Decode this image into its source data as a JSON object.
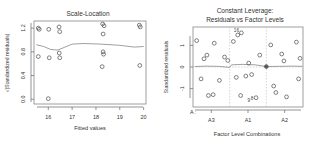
{
  "figure": {
    "background": "#ffffff",
    "point_color": "#555555",
    "line_color": "#888888",
    "axis_color": "#666666",
    "panels": 2
  },
  "chart_data": [
    {
      "type": "scatter",
      "panel": "left",
      "title": "Scale-Location",
      "xlabel": "Fitted values",
      "ylabel": "√|Standardized residuals|",
      "xlim": [
        15.4,
        20.1
      ],
      "ylim": [
        -0.08,
        1.32
      ],
      "xticks": [
        "16",
        "17",
        "18",
        "19",
        "20"
      ],
      "xtick_values": [
        16,
        17,
        18,
        19,
        20
      ],
      "yticks": [
        "0.0",
        "0.4",
        "0.8",
        "1.2"
      ],
      "ytick_values": [
        0.0,
        0.4,
        0.8,
        1.2
      ],
      "grid": false,
      "legend": "none",
      "points": [
        {
          "x": 15.58,
          "y": 1.2
        },
        {
          "x": 15.62,
          "y": 1.18
        },
        {
          "x": 16.02,
          "y": 1.18
        },
        {
          "x": 16.45,
          "y": 1.22
        },
        {
          "x": 16.48,
          "y": 1.14
        },
        {
          "x": 18.28,
          "y": 1.27
        },
        {
          "x": 18.34,
          "y": 1.24
        },
        {
          "x": 18.3,
          "y": 1.1
        },
        {
          "x": 19.82,
          "y": 1.25
        },
        {
          "x": 19.86,
          "y": 1.22
        },
        {
          "x": 15.58,
          "y": 0.72
        },
        {
          "x": 16.04,
          "y": 0.7
        },
        {
          "x": 16.46,
          "y": 0.78
        },
        {
          "x": 16.48,
          "y": 0.7
        },
        {
          "x": 18.3,
          "y": 0.8
        },
        {
          "x": 18.32,
          "y": 0.76
        },
        {
          "x": 18.26,
          "y": 0.55
        },
        {
          "x": 19.84,
          "y": 0.57
        },
        {
          "x": 16.0,
          "y": 0.01
        }
      ],
      "smooth_line": [
        {
          "x": 15.5,
          "y": 0.92
        },
        {
          "x": 15.8,
          "y": 0.89
        },
        {
          "x": 16.1,
          "y": 0.84
        },
        {
          "x": 16.4,
          "y": 0.83
        },
        {
          "x": 16.7,
          "y": 0.88
        },
        {
          "x": 17.0,
          "y": 0.93
        },
        {
          "x": 17.5,
          "y": 0.94
        },
        {
          "x": 18.2,
          "y": 0.93
        },
        {
          "x": 19.0,
          "y": 0.91
        },
        {
          "x": 19.6,
          "y": 0.88
        },
        {
          "x": 20.0,
          "y": 0.89
        }
      ],
      "point_labels": []
    },
    {
      "type": "scatter",
      "panel": "right",
      "title_line1": "Constant Leverage:",
      "title_line2": "Residuals vs Factor Levels",
      "title": "Constant Leverage: Residuals vs Factor Levels",
      "xlabel": "Factor Level Combinations",
      "ylabel": "Standardized residuals",
      "group_axis_label": "A :",
      "xlim": [
        0,
        3
      ],
      "ylim": [
        -1.85,
        1.85
      ],
      "xticks": [
        "A3",
        "A1",
        "A2"
      ],
      "xtick_values": [
        0.5,
        1.5,
        2.5
      ],
      "yticks": [
        "1",
        "0",
        "-1"
      ],
      "ytick_values": [
        1,
        0,
        -1
      ],
      "grid": false,
      "legend": "none",
      "reference_line_y": 0,
      "group_separators": [
        1.0,
        2.0
      ],
      "points": [
        {
          "x": 0.1,
          "y": 1.22
        },
        {
          "x": 0.22,
          "y": -0.55
        },
        {
          "x": 0.3,
          "y": 0.38
        },
        {
          "x": 0.38,
          "y": 0.55
        },
        {
          "x": 0.42,
          "y": -1.32
        },
        {
          "x": 0.55,
          "y": -1.28
        },
        {
          "x": 0.58,
          "y": 1.1
        },
        {
          "x": 0.72,
          "y": -0.62
        },
        {
          "x": 0.86,
          "y": 0.46
        },
        {
          "x": 0.95,
          "y": 0.3
        },
        {
          "x": 1.1,
          "y": 1.18
        },
        {
          "x": 1.18,
          "y": -0.48
        },
        {
          "x": 1.22,
          "y": 1.48
        },
        {
          "x": 1.32,
          "y": 1.58
        },
        {
          "x": 1.3,
          "y": -1.32
        },
        {
          "x": 1.44,
          "y": -0.42
        },
        {
          "x": 1.52,
          "y": 0.18
        },
        {
          "x": 1.6,
          "y": -0.35
        },
        {
          "x": 1.72,
          "y": -1.42
        },
        {
          "x": 1.82,
          "y": 0.55
        },
        {
          "x": 2.0,
          "y": 0.02
        },
        {
          "x": 2.12,
          "y": 1.02
        },
        {
          "x": 2.2,
          "y": -0.88
        },
        {
          "x": 2.26,
          "y": -1.18
        },
        {
          "x": 2.42,
          "y": 0.6
        },
        {
          "x": 2.48,
          "y": 0.28
        },
        {
          "x": 2.55,
          "y": -1.38
        },
        {
          "x": 2.82,
          "y": 1.15
        },
        {
          "x": 2.88,
          "y": -0.55
        },
        {
          "x": 2.92,
          "y": 0.4
        }
      ],
      "solid_points": [
        {
          "x": 2.0,
          "y": 0.02
        }
      ],
      "smooth_line": [
        {
          "x": 0.05,
          "y": 0.02
        },
        {
          "x": 0.35,
          "y": 0.04
        },
        {
          "x": 0.7,
          "y": 0.03
        },
        {
          "x": 1.0,
          "y": -0.02
        },
        {
          "x": 1.05,
          "y": 0.1
        },
        {
          "x": 1.35,
          "y": 0.12
        },
        {
          "x": 1.7,
          "y": 0.1
        },
        {
          "x": 2.0,
          "y": 0.02
        },
        {
          "x": 2.35,
          "y": 0.03
        },
        {
          "x": 2.7,
          "y": 0.04
        },
        {
          "x": 2.98,
          "y": 0.03
        }
      ],
      "point_labels": [
        {
          "x": 1.32,
          "y": 1.58,
          "text": "16",
          "dx": -5,
          "dy": -1
        },
        {
          "x": 1.44,
          "y": -1.52,
          "text": "9",
          "dx": 3,
          "dy": 2
        },
        {
          "x": 1.72,
          "y": -1.5,
          "text": "8",
          "dx": -4,
          "dy": 1
        }
      ]
    }
  ]
}
